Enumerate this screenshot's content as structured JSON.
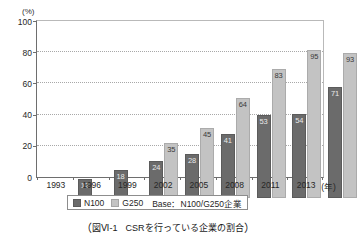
{
  "chart_data": {
    "type": "bar",
    "title": "",
    "xlabel": "",
    "ylabel": "",
    "unit_label": "(%)",
    "x_unit_label": "(年)",
    "categories": [
      "1993",
      "1996",
      "1999",
      "2002",
      "2005",
      "2008",
      "2011",
      "2013"
    ],
    "series": [
      {
        "name": "N100",
        "color": "#6b6b6b",
        "values": [
          12,
          18,
          24,
          28,
          41,
          53,
          54,
          71
        ]
      },
      {
        "name": "G250",
        "color": "#c3c3c3",
        "values": [
          null,
          null,
          35,
          45,
          64,
          83,
          95,
          93
        ]
      }
    ],
    "ylim": [
      0,
      100
    ],
    "yticks": [
      0,
      20,
      40,
      60,
      80,
      100
    ],
    "ytick_labels": [
      "0",
      "20",
      "40",
      "60",
      "80",
      "100"
    ],
    "grid": true,
    "grid_axis": "y",
    "legend_position": "bottom"
  },
  "legend": {
    "items": [
      {
        "label": "N100",
        "swatch": "n100"
      },
      {
        "label": "G250",
        "swatch": "g250"
      }
    ],
    "base_note": "Base：N100/G250企業"
  },
  "caption": {
    "open_paren": "（",
    "figure_number": "図Ⅵ-1",
    "text": "CSRを行っている企業の割合",
    "close_paren": "）"
  }
}
